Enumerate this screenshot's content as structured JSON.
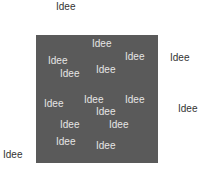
{
  "colors": {
    "square": "#5a5a5a",
    "outer_text": "#333333",
    "inner_text": "#e6e6e6"
  },
  "outer_words": [
    {
      "text": "Idee",
      "x": 56,
      "y": 2
    },
    {
      "text": "Idee",
      "x": 170,
      "y": 53
    },
    {
      "text": "Idee",
      "x": 178,
      "y": 104
    },
    {
      "text": "Idee",
      "x": 3,
      "y": 150
    }
  ],
  "inner_words": [
    {
      "text": "Idee",
      "x": 92,
      "y": 39
    },
    {
      "text": "Idee",
      "x": 48,
      "y": 56
    },
    {
      "text": "Idee",
      "x": 125,
      "y": 52
    },
    {
      "text": "Idee",
      "x": 60,
      "y": 69
    },
    {
      "text": "Idee",
      "x": 96,
      "y": 65
    },
    {
      "text": "Idee",
      "x": 44,
      "y": 99
    },
    {
      "text": "Idee",
      "x": 84,
      "y": 95
    },
    {
      "text": "Idee",
      "x": 125,
      "y": 95
    },
    {
      "text": "Idee",
      "x": 96,
      "y": 107
    },
    {
      "text": "Idee",
      "x": 60,
      "y": 120
    },
    {
      "text": "Idee",
      "x": 109,
      "y": 120
    },
    {
      "text": "Idee",
      "x": 56,
      "y": 137
    },
    {
      "text": "Idee",
      "x": 96,
      "y": 141
    }
  ]
}
